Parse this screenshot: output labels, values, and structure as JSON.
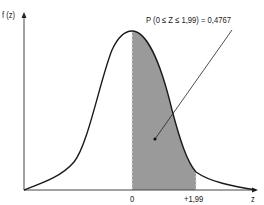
{
  "diagram": {
    "y_axis_label": "f (z)",
    "x_axis_label": "z",
    "tick_labels": [
      "0",
      "+1,99"
    ],
    "annotation": "P (0 ≤ Z ≤ 1,99) = 0,4767",
    "shaded_region": {
      "from": 0,
      "to": 1.99,
      "probability": 0.4767
    },
    "colors": {
      "curve": "#1a1a1a",
      "shade": "#9a9a9a",
      "axis": "#333333"
    }
  }
}
